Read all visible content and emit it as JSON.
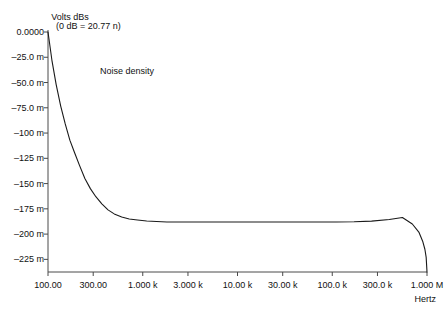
{
  "chart_data": {
    "type": "line",
    "title": "",
    "annotation": "(0 dB = 20.77 n)",
    "series_label": "Noise density",
    "xlabel": "Hertz",
    "ylabel": "Volts dBs",
    "xscale": "log",
    "xlim": [
      100,
      1000000
    ],
    "ylim": [
      -0.2375,
      0.0
    ],
    "grid": false,
    "legend": "none",
    "xtick_labels": [
      "100.00",
      "300.00",
      "1.000 k",
      "3.000 k",
      "10.00 k",
      "30.00 k",
      "100.0 k",
      "300.0 k",
      "1.000 M"
    ],
    "xtick_values": [
      100,
      300,
      1000,
      3000,
      10000,
      30000,
      100000,
      300000,
      1000000
    ],
    "ytick_labels": [
      "0.0000",
      "–25.0 m",
      "–50.0 m",
      "–75.0 m",
      "–100 m",
      "–125 m",
      "–150 m",
      "–175 m",
      "–200 m",
      "–225 m"
    ],
    "ytick_values": [
      0.0,
      -0.025,
      -0.05,
      -0.075,
      -0.1,
      -0.125,
      -0.15,
      -0.175,
      -0.2,
      -0.225
    ],
    "x": [
      100,
      110,
      122,
      136,
      152,
      170,
      190,
      215,
      245,
      280,
      320,
      370,
      430,
      500,
      600,
      720,
      880,
      1100,
      1400,
      1800,
      2400,
      3200,
      4300,
      5800,
      8000,
      12000,
      18000,
      28000,
      45000,
      70000,
      110000,
      170000,
      260000,
      400000,
      550000,
      700000,
      820000,
      900000,
      950000,
      980000,
      1000000
    ],
    "y": [
      0.0,
      -0.028,
      -0.052,
      -0.073,
      -0.091,
      -0.107,
      -0.119,
      -0.132,
      -0.145,
      -0.155,
      -0.163,
      -0.17,
      -0.176,
      -0.18,
      -0.183,
      -0.185,
      -0.186,
      -0.187,
      -0.1875,
      -0.188,
      -0.188,
      -0.188,
      -0.188,
      -0.188,
      -0.188,
      -0.188,
      -0.188,
      -0.188,
      -0.188,
      -0.188,
      -0.188,
      -0.1878,
      -0.1872,
      -0.1855,
      -0.1835,
      -0.19,
      -0.198,
      -0.207,
      -0.215,
      -0.223,
      -0.2375
    ]
  },
  "axis": {
    "y_title": "Volts dBs",
    "x_title": "Hertz"
  },
  "annotations": {
    "db_reference": "(0 dB = 20.77 n)",
    "curve_name": "Noise density"
  },
  "colors": {
    "axis": "#4a4a4a",
    "curve": "#1a1a1a",
    "text": "#111111",
    "background": "#ffffff"
  }
}
